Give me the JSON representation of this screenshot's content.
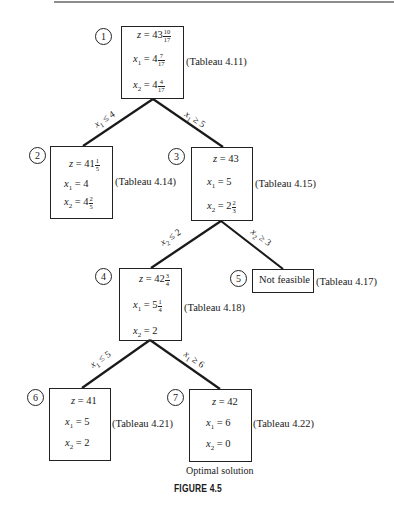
{
  "figure_caption": "FIGURE 4.5",
  "optimal_label": "Optimal solution",
  "nodes": [
    {
      "id": "1",
      "z": {
        "whole": "43",
        "num": "10",
        "den": "17"
      },
      "x1": {
        "whole": "4",
        "num": "7",
        "den": "17"
      },
      "x2": {
        "whole": "4",
        "num": "4",
        "den": "17"
      },
      "tableau": "(Tableau 4.11)"
    },
    {
      "id": "2",
      "z": {
        "whole": "41",
        "num": "1",
        "den": "5"
      },
      "x1": {
        "whole": "4"
      },
      "x2": {
        "whole": "4",
        "num": "2",
        "den": "5"
      },
      "tableau": "(Tableau 4.14)"
    },
    {
      "id": "3",
      "z": {
        "whole": "43"
      },
      "x1": {
        "whole": "5"
      },
      "x2": {
        "whole": "2",
        "num": "2",
        "den": "3"
      },
      "tableau": "(Tableau 4.15)"
    },
    {
      "id": "4",
      "z": {
        "whole": "42",
        "num": "3",
        "den": "4"
      },
      "x1": {
        "whole": "5",
        "num": "1",
        "den": "4"
      },
      "x2": {
        "whole": "2"
      },
      "tableau": "(Tableau 4.18)"
    },
    {
      "id": "5",
      "status": "Not feasible",
      "tableau": "(Tableau 4.17)"
    },
    {
      "id": "6",
      "z": {
        "whole": "41"
      },
      "x1": {
        "whole": "5"
      },
      "x2": {
        "whole": "2"
      },
      "tableau": "(Tableau 4.21)"
    },
    {
      "id": "7",
      "z": {
        "whole": "42"
      },
      "x1": {
        "whole": "6"
      },
      "x2": {
        "whole": "0"
      },
      "tableau": "(Tableau 4.22)"
    }
  ],
  "edges": [
    {
      "from": "1",
      "to": "2",
      "var": "x",
      "sub": "1",
      "op": "≤",
      "val": "4"
    },
    {
      "from": "1",
      "to": "3",
      "var": "x",
      "sub": "1",
      "op": "≥",
      "val": "5"
    },
    {
      "from": "3",
      "to": "4",
      "var": "x",
      "sub": "2",
      "op": "≤",
      "val": "2"
    },
    {
      "from": "3",
      "to": "5",
      "var": "x",
      "sub": "2",
      "op": "≥",
      "val": "3"
    },
    {
      "from": "4",
      "to": "6",
      "var": "x",
      "sub": "1",
      "op": "≤",
      "val": "5"
    },
    {
      "from": "4",
      "to": "7",
      "var": "x",
      "sub": "1",
      "op": "≥",
      "val": "6"
    }
  ],
  "labels": {
    "z": "z",
    "x": "x",
    "sub1": "1",
    "sub2": "2",
    "eq": " = "
  }
}
